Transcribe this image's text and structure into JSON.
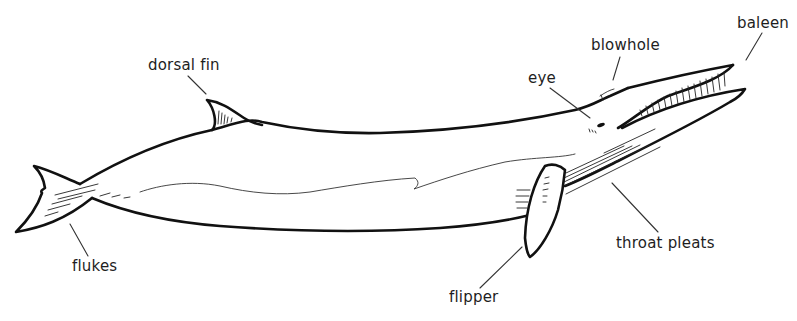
{
  "diagram": {
    "labels": {
      "dorsal_fin": "dorsal fin",
      "blowhole": "blowhole",
      "baleen": "baleen",
      "eye": "eye",
      "flukes": "flukes",
      "flipper": "flipper",
      "throat_pleats": "throat pleats"
    },
    "colors": {
      "background": "#ffffff",
      "line": "#111111",
      "text": "#1e1e1e"
    }
  }
}
